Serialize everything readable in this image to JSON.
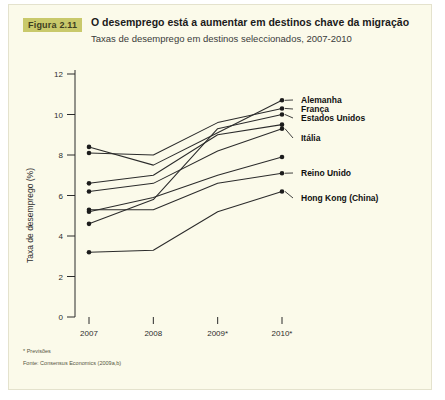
{
  "figure": {
    "badge": "Figura 2.11",
    "title": "O desemprego está a aumentar em destinos chave da migração",
    "subtitle": "Taxas de desemprego em destinos seleccionados, 2007-2010",
    "footnote_forecast": "* Previsões",
    "footnote_source": "Fonte: Consensus Economics (2009a,b)",
    "badge_color": "#c9c96b",
    "panel_color": "#fbfaea",
    "line_color": "#2b2b2b"
  },
  "chart_data": {
    "type": "line",
    "title": "O desemprego está a aumentar em destinos chave da migração",
    "subtitle": "Taxas de desemprego em destinos seleccionados, 2007-2010",
    "xlabel": "",
    "ylabel": "Taxa de desemprego (%)",
    "x": [
      "2007",
      "2008",
      "2009*",
      "2010*"
    ],
    "xtick_labels": [
      "2007",
      "2008",
      "2009*",
      "2010*"
    ],
    "ytick_labels": [
      "0",
      "2",
      "4",
      "6",
      "8",
      "10",
      "12"
    ],
    "yticks": [
      0,
      2,
      4,
      6,
      8,
      10,
      12
    ],
    "ylim": [
      0,
      12
    ],
    "grid": false,
    "legend_position": "right-inline",
    "markers": "endpoints",
    "series": [
      {
        "name": "Alemanha",
        "label": "Alemanha",
        "labelled": true,
        "values": [
          8.4,
          7.5,
          9.1,
          10.7
        ]
      },
      {
        "name": "França",
        "label": "França",
        "labelled": true,
        "values": [
          8.1,
          8.0,
          9.6,
          10.3
        ]
      },
      {
        "name": "Estados Unidos",
        "label": "Estados Unidos",
        "labelled": true,
        "values": [
          4.6,
          5.8,
          9.3,
          10.0
        ]
      },
      {
        "name": "Serie 4",
        "label": "",
        "labelled": false,
        "values": [
          6.6,
          7.0,
          9.0,
          9.5
        ]
      },
      {
        "name": "Itália",
        "label": "Itália",
        "labelled": true,
        "values": [
          6.2,
          6.6,
          8.2,
          9.3
        ]
      },
      {
        "name": "Serie 6",
        "label": "",
        "labelled": false,
        "values": [
          5.2,
          5.9,
          7.0,
          7.9
        ]
      },
      {
        "name": "Reino Unido",
        "label": "Reino Unido",
        "labelled": true,
        "values": [
          5.3,
          5.3,
          6.6,
          7.1
        ]
      },
      {
        "name": "Hong Kong (China)",
        "label": "Hong Kong (China)",
        "labelled": true,
        "values": [
          3.2,
          3.3,
          5.2,
          6.2
        ]
      }
    ],
    "labels_right": [
      {
        "text": "Alemanha",
        "value": 10.7
      },
      {
        "text": "França",
        "value": 10.3
      },
      {
        "text": "Estados Unidos",
        "value": 10.0
      },
      {
        "text": "Itália",
        "value": 9.3
      },
      {
        "text": "Reino Unido",
        "value": 7.1
      },
      {
        "text": "Hong Kong (China)",
        "value": 6.2
      }
    ]
  }
}
